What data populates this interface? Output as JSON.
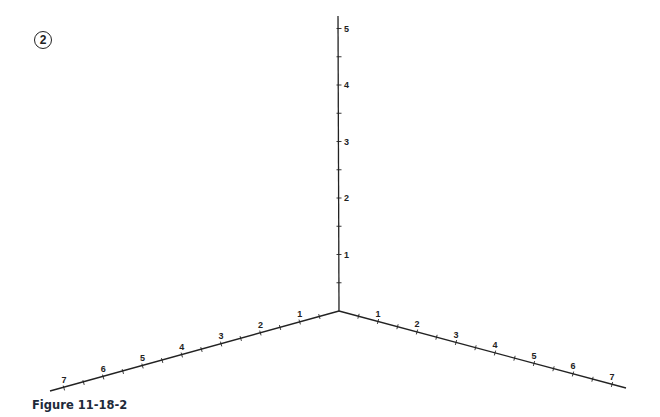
{
  "figure": {
    "badge": "2",
    "caption": "Figure 11-18-2"
  },
  "axes": {
    "vertical": {
      "labels": [
        "1",
        "2",
        "3",
        "4",
        "5"
      ]
    },
    "left": {
      "labels": [
        "1",
        "2",
        "3",
        "4",
        "5",
        "6",
        "7"
      ]
    },
    "right": {
      "labels": [
        "1",
        "2",
        "3",
        "4",
        "5",
        "6",
        "7"
      ]
    }
  },
  "colors": {
    "axis": "#222222",
    "caption": "#1d2a3a"
  }
}
